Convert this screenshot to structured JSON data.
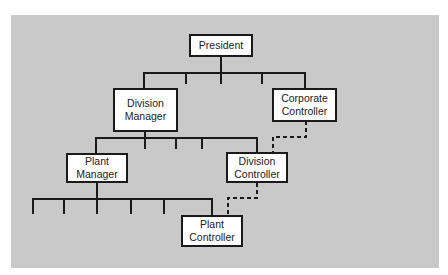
{
  "diagram": {
    "type": "organization-chart",
    "background_color": "#c9c9c9",
    "line_color": "#1a1a1a",
    "nodes": {
      "president": {
        "line1": "President",
        "line2": ""
      },
      "division_manager": {
        "line1": "Division",
        "line2": "Manager"
      },
      "corporate_controller": {
        "line1": "Corporate",
        "line2": "Controller"
      },
      "plant_manager": {
        "line1": "Plant",
        "line2": "Manager"
      },
      "division_controller": {
        "line1": "Division",
        "line2": "Controller"
      },
      "plant_controller": {
        "line1": "Plant",
        "line2": "Controller"
      }
    },
    "edges": [
      {
        "from": "President",
        "to": "Division Manager",
        "style": "solid"
      },
      {
        "from": "President",
        "to": "Corporate Controller",
        "style": "solid"
      },
      {
        "from": "Division Manager",
        "to": "Plant Manager",
        "style": "solid"
      },
      {
        "from": "Division Manager",
        "to": "Division Controller",
        "style": "solid"
      },
      {
        "from": "Corporate Controller",
        "to": "Division Controller",
        "style": "dashed"
      },
      {
        "from": "Plant Manager",
        "to": "Plant Controller",
        "style": "solid"
      },
      {
        "from": "Division Controller",
        "to": "Plant Controller",
        "style": "dashed"
      }
    ]
  }
}
